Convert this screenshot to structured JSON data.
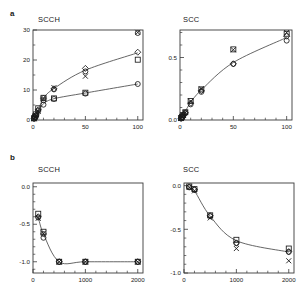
{
  "figure": {
    "panel_a_label": "a",
    "panel_b_label": "b"
  },
  "panels": {
    "a_left": {
      "title": "SCCH"
    },
    "a_right": {
      "title": "SCC"
    },
    "b_left": {
      "title": "SCCH"
    },
    "b_right": {
      "title": "SCC"
    }
  },
  "chart_data": [
    {
      "id": "a-left",
      "type": "scatter",
      "title": "SCCH",
      "panel": "a",
      "xlabel": "",
      "ylabel": "",
      "xlim": [
        0,
        105
      ],
      "ylim": [
        0,
        30
      ],
      "xticks": [
        0,
        50,
        100
      ],
      "xticklabels": [
        "0",
        "50",
        "100"
      ],
      "xminor_step": 10,
      "yticks": [
        0,
        10,
        20,
        30
      ],
      "yticklabels": [
        "0",
        "10",
        "20",
        "30"
      ],
      "yminor_step": 5,
      "grid": false,
      "legend": "none",
      "series": [
        {
          "name": "circle-upper",
          "marker": "circle",
          "x": [
            1,
            2,
            3,
            5,
            10,
            20,
            50,
            100
          ],
          "y": [
            0.4,
            0.9,
            1.5,
            3.0,
            6.6,
            10.2,
            16.2,
            29.0
          ]
        },
        {
          "name": "diamond",
          "marker": "diamond",
          "x": [
            1,
            2,
            3,
            5,
            10,
            20,
            50,
            100
          ],
          "y": [
            0.5,
            1.0,
            1.7,
            3.4,
            7.3,
            10.4,
            17.2,
            22.6
          ]
        },
        {
          "name": "cross",
          "marker": "x",
          "x": [
            1,
            2,
            3,
            5,
            10,
            20,
            50,
            100
          ],
          "y": [
            0.4,
            0.8,
            1.4,
            2.9,
            7.0,
            10.8,
            14.6,
            29.2
          ]
        },
        {
          "name": "square-lower",
          "marker": "square",
          "x": [
            1,
            2,
            3,
            5,
            10,
            20,
            50,
            100
          ],
          "y": [
            0.6,
            1.2,
            1.9,
            3.9,
            7.4,
            7.2,
            9.1,
            20.1
          ]
        },
        {
          "name": "circle-lower",
          "marker": "circle",
          "x": [
            10,
            20,
            50,
            100
          ],
          "y": [
            5.1,
            7.0,
            8.8,
            12.0
          ]
        }
      ],
      "fit_curves": [
        {
          "name": "upper-fit",
          "x": [
            1,
            5,
            10,
            20,
            50,
            100
          ],
          "y": [
            0.6,
            3.3,
            7.2,
            10.5,
            16.6,
            22.4
          ]
        },
        {
          "name": "lower-fit",
          "x": [
            1,
            5,
            10,
            20,
            50,
            100
          ],
          "y": [
            0.6,
            3.0,
            5.4,
            7.1,
            9.0,
            12.0
          ]
        }
      ]
    },
    {
      "id": "a-right",
      "type": "scatter",
      "title": "SCC",
      "panel": "a",
      "xlabel": "",
      "ylabel": "",
      "xlim": [
        0,
        105
      ],
      "ylim": [
        0,
        0.72
      ],
      "xticks": [
        0,
        50,
        100
      ],
      "xticklabels": [
        "0",
        "50",
        "100"
      ],
      "xminor_step": 10,
      "yticks": [
        0.0,
        0.5
      ],
      "yticklabels": [
        "0.0",
        "0.5"
      ],
      "yminor_step": 0.1,
      "grid": false,
      "legend": "none",
      "series": [
        {
          "name": "circle",
          "marker": "circle",
          "x": [
            1,
            2,
            3,
            5,
            10,
            20,
            50,
            100
          ],
          "y": [
            0.012,
            0.022,
            0.035,
            0.055,
            0.125,
            0.225,
            0.448,
            0.635
          ]
        },
        {
          "name": "square",
          "marker": "square",
          "x": [
            1,
            2,
            3,
            5,
            10,
            20,
            50,
            100
          ],
          "y": [
            0.015,
            0.026,
            0.04,
            0.062,
            0.152,
            0.245,
            0.565,
            0.69
          ]
        },
        {
          "name": "diamond",
          "marker": "diamond",
          "x": [
            1,
            2,
            3,
            5,
            10,
            20,
            50,
            100
          ],
          "y": [
            0.013,
            0.024,
            0.037,
            0.058,
            0.135,
            0.235,
            0.45,
            0.67
          ]
        },
        {
          "name": "cross",
          "marker": "x",
          "x": [
            1,
            2,
            3,
            5,
            10,
            20,
            50,
            100
          ],
          "y": [
            0.014,
            0.025,
            0.038,
            0.06,
            0.15,
            0.25,
            0.562,
            0.7
          ]
        }
      ],
      "fit_curves": [
        {
          "name": "fit",
          "x": [
            1,
            5,
            10,
            20,
            50,
            100
          ],
          "y": [
            0.015,
            0.07,
            0.14,
            0.24,
            0.46,
            0.66
          ]
        }
      ]
    },
    {
      "id": "b-left",
      "type": "scatter",
      "title": "SCCH",
      "panel": "b",
      "xlabel": "",
      "ylabel": "",
      "xlim": [
        0,
        2100
      ],
      "ylim": [
        -1.15,
        0.05
      ],
      "xticks": [
        0,
        1000,
        2000
      ],
      "xticklabels": [
        "0",
        "1000",
        "2000"
      ],
      "xminor_step": 200,
      "yticks": [
        0.0,
        -0.5,
        -1.0
      ],
      "yticklabels": [
        "0.0",
        "-0.5",
        "-1.0"
      ],
      "yminor_step": 0.1,
      "grid": false,
      "legend": "none",
      "series": [
        {
          "name": "square",
          "marker": "square",
          "x": [
            100,
            200,
            500,
            1000,
            2000
          ],
          "y": [
            -0.36,
            -0.6,
            -1.0,
            -1.0,
            -1.0
          ]
        },
        {
          "name": "circle",
          "marker": "circle",
          "x": [
            100,
            200,
            500,
            1000,
            2000
          ],
          "y": [
            -0.41,
            -0.68,
            -1.0,
            -1.0,
            -1.0
          ]
        },
        {
          "name": "diamond",
          "marker": "diamond",
          "x": [
            100,
            200,
            500,
            1000,
            2000
          ],
          "y": [
            -0.4,
            -0.63,
            -1.0,
            -1.0,
            -1.0
          ]
        },
        {
          "name": "cross",
          "marker": "x",
          "x": [
            100,
            200,
            500,
            1000,
            2000
          ],
          "y": [
            -0.42,
            -0.62,
            -1.0,
            -1.0,
            -1.0
          ]
        }
      ],
      "fit_curves": [
        {
          "name": "fit",
          "x": [
            100,
            200,
            500,
            1000,
            2000
          ],
          "y": [
            -0.4,
            -0.63,
            -1.0,
            -1.0,
            -1.0
          ]
        }
      ]
    },
    {
      "id": "b-right",
      "type": "scatter",
      "title": "SCC",
      "panel": "b",
      "xlabel": "",
      "ylabel": "",
      "xlim": [
        0,
        2100
      ],
      "ylim": [
        -1.0,
        0.03
      ],
      "xticks": [
        0,
        1000,
        2000
      ],
      "xticklabels": [
        "0",
        "1000",
        "2000"
      ],
      "xminor_step": 200,
      "yticks": [
        0.0,
        -0.5,
        -1.0
      ],
      "yticklabels": [
        "0.0",
        "-0.5",
        "-1.0"
      ],
      "yminor_step": 0.1,
      "grid": false,
      "legend": "none",
      "series": [
        {
          "name": "square",
          "marker": "square",
          "x": [
            100,
            200,
            500,
            1000,
            2000
          ],
          "y": [
            -0.01,
            -0.04,
            -0.34,
            -0.62,
            -0.72
          ]
        },
        {
          "name": "circle",
          "marker": "circle",
          "x": [
            100,
            200,
            500,
            1000,
            2000
          ],
          "y": [
            -0.02,
            -0.05,
            -0.35,
            -0.66,
            -0.76
          ]
        },
        {
          "name": "diamond",
          "marker": "diamond",
          "x": [
            100,
            200,
            500,
            1000,
            2000
          ],
          "y": [
            -0.015,
            -0.045,
            -0.345,
            -0.655,
            -0.755
          ]
        },
        {
          "name": "cross",
          "marker": "x",
          "x": [
            100,
            200,
            500,
            1000,
            2000
          ],
          "y": [
            -0.02,
            -0.06,
            -0.37,
            -0.72,
            -0.86
          ]
        }
      ],
      "fit_curves": [
        {
          "name": "fit",
          "x": [
            100,
            200,
            500,
            1000,
            2000
          ],
          "y": [
            -0.02,
            -0.06,
            -0.35,
            -0.63,
            -0.76
          ]
        }
      ]
    }
  ]
}
